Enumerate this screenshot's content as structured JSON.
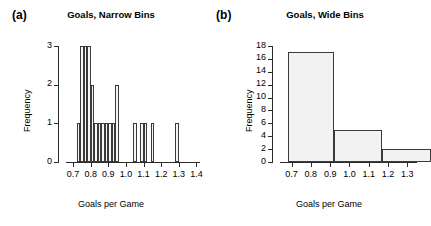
{
  "figure": {
    "background": "#ffffff",
    "bar_fill": "#f4f4f4",
    "bar_stroke": "#3a3a3a",
    "axis_color": "#2b2b2b"
  },
  "panels": [
    {
      "letter": "(a)",
      "title": "Goals, Narrow Bins",
      "xlabel": "Goals per Game",
      "ylabel": "Frequency"
    },
    {
      "letter": "(b)",
      "title": "Goals, Wide Bins",
      "xlabel": "Goals per Game",
      "ylabel": "Frequency"
    }
  ],
  "chart_data": [
    {
      "type": "bar",
      "title": "Goals, Narrow Bins",
      "panel": "(a)",
      "xlabel": "Goals per Game",
      "ylabel": "Frequency",
      "xlim": [
        0.66,
        1.42
      ],
      "ylim": [
        0,
        3
      ],
      "xticks": [
        0.7,
        0.8,
        0.9,
        1.0,
        1.1,
        1.2,
        1.3,
        1.4
      ],
      "xtick_labels": [
        "0.7",
        "0.8",
        "0.9",
        "1.0",
        "1.1",
        "1.2",
        "1.3",
        "1.4"
      ],
      "yticks": [
        0,
        1,
        2,
        3
      ],
      "ytick_labels": [
        "0",
        "1",
        "2",
        "3"
      ],
      "bin_width": 0.02,
      "grid": false,
      "legend": null,
      "bins": [
        {
          "left": 0.72,
          "right": 0.74,
          "value": 1
        },
        {
          "left": 0.74,
          "right": 0.76,
          "value": 3
        },
        {
          "left": 0.76,
          "right": 0.78,
          "value": 3
        },
        {
          "left": 0.78,
          "right": 0.8,
          "value": 3
        },
        {
          "left": 0.8,
          "right": 0.82,
          "value": 2
        },
        {
          "left": 0.82,
          "right": 0.84,
          "value": 1
        },
        {
          "left": 0.84,
          "right": 0.86,
          "value": 1
        },
        {
          "left": 0.86,
          "right": 0.88,
          "value": 1
        },
        {
          "left": 0.88,
          "right": 0.9,
          "value": 1
        },
        {
          "left": 0.9,
          "right": 0.92,
          "value": 1
        },
        {
          "left": 0.92,
          "right": 0.94,
          "value": 1
        },
        {
          "left": 0.94,
          "right": 0.96,
          "value": 2
        },
        {
          "left": 1.04,
          "right": 1.06,
          "value": 1
        },
        {
          "left": 1.08,
          "right": 1.1,
          "value": 1
        },
        {
          "left": 1.1,
          "right": 1.12,
          "value": 1
        },
        {
          "left": 1.14,
          "right": 1.16,
          "value": 1
        },
        {
          "left": 1.28,
          "right": 1.3,
          "value": 1
        }
      ]
    },
    {
      "type": "bar",
      "title": "Goals, Wide Bins",
      "panel": "(b)",
      "xlabel": "Goals per Game",
      "ylabel": "Frequency",
      "xlim": [
        0.64,
        1.35
      ],
      "ylim": [
        0,
        18
      ],
      "xticks": [
        0.7,
        0.8,
        0.9,
        1.0,
        1.1,
        1.2,
        1.3
      ],
      "xtick_labels": [
        "0.7",
        "0.8",
        "0.9",
        "1.0",
        "1.1",
        "1.2",
        "1.3"
      ],
      "yticks": [
        0,
        2,
        4,
        6,
        8,
        10,
        12,
        14,
        16,
        18
      ],
      "ytick_labels": [
        "0",
        "2",
        "4",
        "6",
        "8",
        "10",
        "12",
        "14",
        "16",
        "18"
      ],
      "bin_width": 0.25,
      "grid": false,
      "legend": null,
      "bins": [
        {
          "left": 0.68,
          "right": 0.92,
          "value": 17
        },
        {
          "left": 0.92,
          "right": 1.17,
          "value": 5
        },
        {
          "left": 1.17,
          "right": 1.42,
          "value": 2
        }
      ]
    }
  ]
}
